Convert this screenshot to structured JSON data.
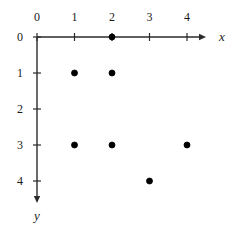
{
  "chart_data": {
    "type": "scatter",
    "title": "",
    "xlabel": "x",
    "ylabel": "y",
    "x_axis": {
      "label": "x",
      "ticks": [
        0,
        1,
        2,
        3,
        4
      ],
      "tick_labels": [
        "0",
        "1",
        "2",
        "3",
        "4"
      ],
      "xlim": [
        0,
        4
      ],
      "orientation": "left-to-right",
      "arrow": true,
      "label_position": "above-axis"
    },
    "y_axis": {
      "label": "y",
      "ticks": [
        0,
        1,
        2,
        3,
        4
      ],
      "tick_labels": [
        "0",
        "1",
        "2",
        "3",
        "4"
      ],
      "ylim": [
        0,
        4
      ],
      "orientation": "top-to-bottom-downward",
      "arrow": true,
      "label_position": "left-of-axis",
      "inverted": true
    },
    "grid": false,
    "legend": null,
    "points": [
      {
        "x": 2,
        "y": 0
      },
      {
        "x": 1,
        "y": 1
      },
      {
        "x": 2,
        "y": 1
      },
      {
        "x": 1,
        "y": 3
      },
      {
        "x": 2,
        "y": 3
      },
      {
        "x": 4,
        "y": 3
      },
      {
        "x": 3,
        "y": 4
      }
    ],
    "marker": {
      "shape": "circle",
      "filled": true,
      "color": "#000000",
      "size_px": 6
    }
  },
  "colors": {
    "background": "#ffffff",
    "axis": "#2b2b2b",
    "marker": "#000000",
    "text": "#1a1a1a"
  },
  "geometry": {
    "origin_x": 37,
    "origin_y": 37,
    "x_step": 37.5,
    "y_step": 36,
    "x_axis_end": 206,
    "y_axis_end": 203,
    "x_label_pos": {
      "x": 222,
      "y": 37
    },
    "y_label_pos": {
      "x": 37,
      "y": 216
    },
    "x_tick_label_y": 17,
    "y_tick_label_x": 20,
    "tick_len": 4
  }
}
